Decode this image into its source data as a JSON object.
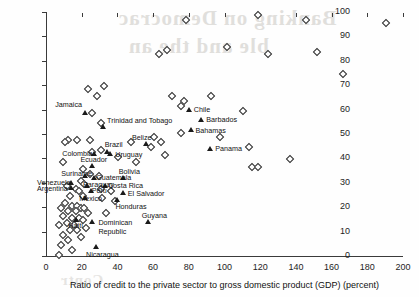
{
  "chart_data": {
    "type": "scatter",
    "title": "",
    "xlabel": "Ratio of credit to the private sector to  gross domestic  product (GDP) (percent)",
    "ylabel": "Percentage of households with a bank account (percent)",
    "xlim": [
      0,
      200
    ],
    "ylim": [
      0,
      100
    ],
    "xticks": [
      0,
      20,
      40,
      60,
      80,
      100,
      120,
      140,
      160,
      180,
      200
    ],
    "yticks": [
      0,
      10,
      20,
      30,
      40,
      50,
      60,
      70,
      80,
      90,
      100
    ],
    "grid": false,
    "legend": "none",
    "marker_styles": {
      "unlabeled": "open-diamond",
      "labeled": "filled-triangle"
    },
    "labeled_points": [
      {
        "name": "Jamaica",
        "x": 22,
        "y": 59
      },
      {
        "name": "Trinidad and Tobago",
        "x": 32,
        "y": 53
      },
      {
        "name": "Chile",
        "x": 80,
        "y": 60
      },
      {
        "name": "Barbados",
        "x": 87,
        "y": 56
      },
      {
        "name": "Bahamas",
        "x": 81,
        "y": 52
      },
      {
        "name": "Belize",
        "x": 56,
        "y": 46
      },
      {
        "name": "Brazil",
        "x": 34,
        "y": 43
      },
      {
        "name": "Uruguay",
        "x": 36,
        "y": 42
      },
      {
        "name": "Colombia",
        "x": 27,
        "y": 42
      },
      {
        "name": "Panama",
        "x": 92,
        "y": 44
      },
      {
        "name": "Ecuador",
        "x": 26,
        "y": 37
      },
      {
        "name": "Suriname",
        "x": 22,
        "y": 33
      },
      {
        "name": "Guatemala",
        "x": 27,
        "y": 32
      },
      {
        "name": "Bolivia",
        "x": 43,
        "y": 32
      },
      {
        "name": "Venezuela",
        "x": 14,
        "y": 30
      },
      {
        "name": "Paraguay",
        "x": 23,
        "y": 29
      },
      {
        "name": "Costa Rica",
        "x": 33,
        "y": 29
      },
      {
        "name": "Argentina",
        "x": 14,
        "y": 28
      },
      {
        "name": "Peru",
        "x": 25,
        "y": 27
      },
      {
        "name": "El Salvador",
        "x": 43,
        "y": 26
      },
      {
        "name": "Mexico",
        "x": 22,
        "y": 24
      },
      {
        "name": "Honduras",
        "x": 40,
        "y": 23
      },
      {
        "name": "Haiti",
        "x": 17,
        "y": 15
      },
      {
        "name": "Dominican Republic",
        "x": 26,
        "y": 14
      },
      {
        "name": "Guyana",
        "x": 57,
        "y": 14
      },
      {
        "name": "Nicaragua",
        "x": 28,
        "y": 4
      }
    ],
    "unlabeled_points": [
      {
        "x": 118,
        "y": 99
      },
      {
        "x": 78,
        "y": 97
      },
      {
        "x": 145,
        "y": 97
      },
      {
        "x": 190,
        "y": 96
      },
      {
        "x": 101,
        "y": 86
      },
      {
        "x": 67,
        "y": 85
      },
      {
        "x": 63,
        "y": 83
      },
      {
        "x": 124,
        "y": 83
      },
      {
        "x": 151,
        "y": 84
      },
      {
        "x": 166,
        "y": 75
      },
      {
        "x": 32,
        "y": 70
      },
      {
        "x": 23,
        "y": 69
      },
      {
        "x": 28,
        "y": 66
      },
      {
        "x": 70,
        "y": 66
      },
      {
        "x": 92,
        "y": 66
      },
      {
        "x": 77,
        "y": 64
      },
      {
        "x": 75,
        "y": 62
      },
      {
        "x": 110,
        "y": 60
      },
      {
        "x": 25,
        "y": 59
      },
      {
        "x": 30,
        "y": 55
      },
      {
        "x": 75,
        "y": 51
      },
      {
        "x": 60,
        "y": 49
      },
      {
        "x": 97,
        "y": 49
      },
      {
        "x": 12,
        "y": 48
      },
      {
        "x": 17,
        "y": 48
      },
      {
        "x": 24,
        "y": 48
      },
      {
        "x": 10,
        "y": 47
      },
      {
        "x": 47,
        "y": 47
      },
      {
        "x": 64,
        "y": 47
      },
      {
        "x": 58,
        "y": 45
      },
      {
        "x": 113,
        "y": 45
      },
      {
        "x": 30,
        "y": 44
      },
      {
        "x": 25,
        "y": 43
      },
      {
        "x": 40,
        "y": 41
      },
      {
        "x": 66,
        "y": 42
      },
      {
        "x": 136,
        "y": 40
      },
      {
        "x": 9,
        "y": 39
      },
      {
        "x": 50,
        "y": 39
      },
      {
        "x": 20,
        "y": 36
      },
      {
        "x": 115,
        "y": 37
      },
      {
        "x": 118,
        "y": 37
      },
      {
        "x": 24,
        "y": 34
      },
      {
        "x": 29,
        "y": 33
      },
      {
        "x": 19,
        "y": 31
      },
      {
        "x": 21,
        "y": 30
      },
      {
        "x": 11,
        "y": 29
      },
      {
        "x": 16,
        "y": 28
      },
      {
        "x": 18,
        "y": 27
      },
      {
        "x": 30,
        "y": 28
      },
      {
        "x": 36,
        "y": 27
      },
      {
        "x": 13,
        "y": 25
      },
      {
        "x": 20,
        "y": 25
      },
      {
        "x": 31,
        "y": 24
      },
      {
        "x": 38,
        "y": 23
      },
      {
        "x": 10,
        "y": 22
      },
      {
        "x": 14,
        "y": 21
      },
      {
        "x": 17,
        "y": 21
      },
      {
        "x": 19,
        "y": 20
      },
      {
        "x": 21,
        "y": 20
      },
      {
        "x": 8,
        "y": 20
      },
      {
        "x": 12,
        "y": 19
      },
      {
        "x": 16,
        "y": 19
      },
      {
        "x": 23,
        "y": 18
      },
      {
        "x": 33,
        "y": 18
      },
      {
        "x": 9,
        "y": 17
      },
      {
        "x": 14,
        "y": 16
      },
      {
        "x": 18,
        "y": 16
      },
      {
        "x": 20,
        "y": 15
      },
      {
        "x": 11,
        "y": 14
      },
      {
        "x": 15,
        "y": 13
      },
      {
        "x": 7,
        "y": 13
      },
      {
        "x": 22,
        "y": 12
      },
      {
        "x": 13,
        "y": 11
      },
      {
        "x": 17,
        "y": 11
      },
      {
        "x": 9,
        "y": 9
      },
      {
        "x": 19,
        "y": 8
      },
      {
        "x": 12,
        "y": 7
      },
      {
        "x": 8,
        "y": 5
      },
      {
        "x": 14,
        "y": 3
      },
      {
        "x": 7,
        "y": 1
      }
    ]
  },
  "bleed_text": {
    "line1": "Banking on Democrac",
    "line2": "ble and the an",
    "line3": "Contr"
  }
}
